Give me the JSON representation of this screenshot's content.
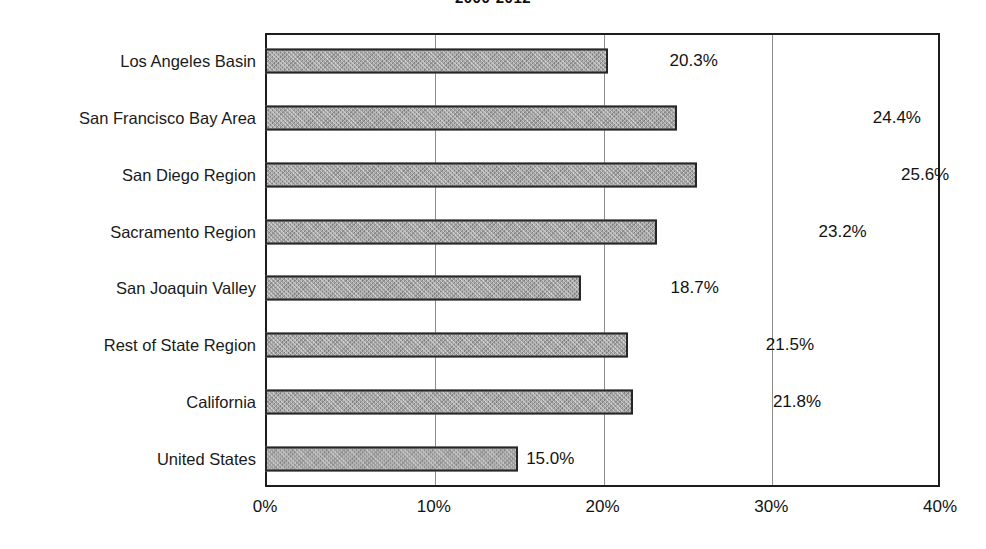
{
  "chart_data": {
    "type": "bar",
    "orientation": "horizontal",
    "title": "2000-2012",
    "title_cropped": true,
    "xlabel": "",
    "ylabel": "",
    "categories": [
      "Los Angeles Basin",
      "San Francisco Bay Area",
      "San Diego Region",
      "Sacramento Region",
      "San Joaquin Valley",
      "Rest of State Region",
      "California",
      "United States"
    ],
    "values": [
      20.3,
      24.4,
      25.6,
      23.2,
      18.7,
      21.5,
      21.8,
      15.0
    ],
    "data_labels": [
      "20.3%",
      "24.4%",
      "25.6%",
      "23.2%",
      "18.7%",
      "21.5%",
      "21.8%",
      "15.0%"
    ],
    "label_offsets_px": [
      62,
      196,
      204,
      162,
      90,
      138,
      140,
      8
    ],
    "xlim": [
      0,
      40
    ],
    "xticks": [
      0,
      10,
      20,
      30,
      40
    ],
    "xtick_labels": [
      "0%",
      "10%",
      "20%",
      "30%",
      "40%"
    ],
    "grid": true,
    "gridlines_at": [
      10,
      20,
      30
    ],
    "legend": null,
    "colors": {
      "bar_fill": "#9d9d9d",
      "bar_border": "#262626",
      "plot_border": "#1c1c1c",
      "gridline": "#8c8c8c",
      "text": "#1a1a1a",
      "background": "#ffffff"
    }
  }
}
